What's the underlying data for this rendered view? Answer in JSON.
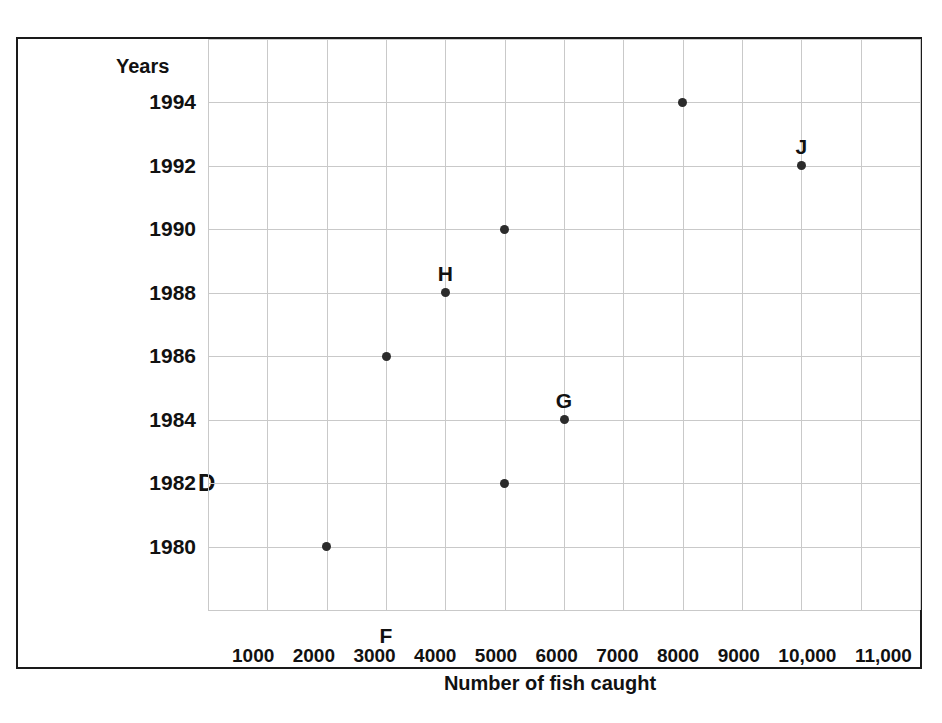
{
  "chart_data": {
    "type": "scatter",
    "title": "",
    "xlabel": "Number of fish caught",
    "ylabel": "Years",
    "xticklabels": [
      "1000",
      "2000",
      "3000",
      "4000",
      "5000",
      "6000",
      "7000",
      "8000",
      "9000",
      "10,000",
      "11,000"
    ],
    "xticks": [
      1000,
      2000,
      3000,
      4000,
      5000,
      6000,
      7000,
      8000,
      9000,
      10000,
      11000
    ],
    "yticklabels": [
      "1994",
      "1992",
      "1990",
      "1988",
      "1986",
      "1984",
      "1982",
      "1980"
    ],
    "yticks": [
      1994,
      1992,
      1990,
      1988,
      1986,
      1984,
      1982,
      1980
    ],
    "xlim": [
      500,
      11500
    ],
    "ylim": [
      1978.5,
      1995.5
    ],
    "grid": true,
    "legend": "none",
    "points": [
      {
        "x": 2000,
        "y": 1980,
        "label": ""
      },
      {
        "x": 5000,
        "y": 1982,
        "label": ""
      },
      {
        "x": 6000,
        "y": 1984,
        "label": "G"
      },
      {
        "x": 3000,
        "y": 1986,
        "label": ""
      },
      {
        "x": 4000,
        "y": 1988,
        "label": "H"
      },
      {
        "x": 5000,
        "y": 1990,
        "label": ""
      },
      {
        "x": 10000,
        "y": 1992,
        "label": "J"
      },
      {
        "x": 8000,
        "y": 1994,
        "label": ""
      }
    ],
    "annotations": [
      {
        "text": "D",
        "anchor": "left-of-1982-axis"
      },
      {
        "text": "F",
        "anchor": "below-3000-gridline"
      },
      {
        "text": "G",
        "anchor": "above-point-6000-1984"
      },
      {
        "text": "H",
        "anchor": "above-point-4000-1988"
      },
      {
        "text": "J",
        "anchor": "above-point-10000-1992"
      }
    ],
    "colors": {
      "point": "#2b2b2b",
      "grid": "#c9c9c9",
      "frame": "#1a1a1a",
      "text": "#111111",
      "background": "#ffffff"
    }
  },
  "axes": {
    "y_title": "Years",
    "x_title": "Number of fish caught"
  },
  "markers": {
    "d": "D",
    "f": "F",
    "g": "G",
    "h": "H",
    "j": "J"
  }
}
